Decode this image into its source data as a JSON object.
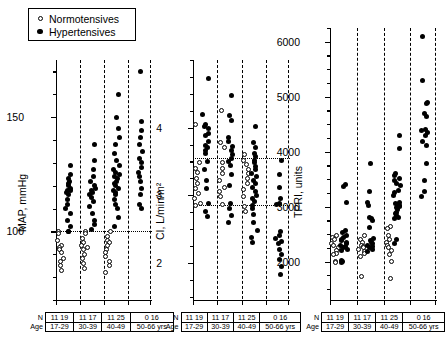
{
  "legend": {
    "items": [
      {
        "marker": "open-circle",
        "label": "Normotensives"
      },
      {
        "marker": "filled-circle",
        "label": "Hypertensives"
      }
    ]
  },
  "table": {
    "row_headers": [
      "N",
      "Age"
    ],
    "n_values": [
      "11 19",
      "11 17",
      "11 25",
      "0 16"
    ],
    "age_values": [
      "17-29",
      "30-39",
      "40-49",
      "50-66 yrs"
    ]
  },
  "chart_data": [
    {
      "type": "scatter",
      "title": "",
      "panel_id": "map",
      "ylabel": "MAP, mmHg",
      "xlabel": "",
      "ylim": [
        70,
        175
      ],
      "yticks": [
        100,
        150
      ],
      "ytick_labels": [
        "100",
        "150"
      ],
      "minor_tick_step": 10,
      "grid": false,
      "reference_lines": [
        100
      ],
      "categories": [
        "17-29",
        "30-39",
        "40-49",
        "50-66 yrs"
      ],
      "legend_position": "top-left",
      "series": [
        {
          "name": "Normotensives",
          "marker": "open-circle",
          "groups": [
            {
              "category": "17-29",
              "values": [
                100,
                99,
                96,
                94,
                93,
                92,
                91,
                88,
                87,
                85,
                83
              ]
            },
            {
              "category": "30-39",
              "values": [
                100,
                99,
                97,
                95,
                94,
                93,
                92,
                90,
                88,
                86,
                84
              ]
            },
            {
              "category": "40-49",
              "values": [
                100,
                98,
                96,
                95,
                94,
                92,
                91,
                89,
                87,
                85,
                82
              ]
            },
            {
              "category": "50-66 yrs",
              "values": []
            }
          ]
        },
        {
          "name": "Hypertensives",
          "marker": "filled-circle",
          "groups": [
            {
              "category": "17-29",
              "values": [
                129,
                125,
                123,
                122,
                121,
                120,
                119,
                118,
                118,
                117,
                116,
                114,
                112,
                110,
                108,
                105,
                102,
                100,
                100
              ]
            },
            {
              "category": "30-39",
              "values": [
                138,
                131,
                127,
                124,
                122,
                120,
                119,
                118,
                117,
                116,
                115,
                113,
                111,
                108,
                105,
                103,
                101
              ]
            },
            {
              "category": "40-49",
              "values": [
                160,
                150,
                145,
                141,
                138,
                134,
                131,
                129,
                127,
                126,
                125,
                124,
                123,
                122,
                121,
                120,
                119,
                118,
                117,
                116,
                114,
                112,
                110,
                106,
                102
              ]
            },
            {
              "category": "50-66 yrs",
              "values": [
                170,
                148,
                144,
                141,
                138,
                135,
                132,
                130,
                128,
                126,
                124,
                122,
                119,
                116,
                112,
                110
              ]
            }
          ]
        }
      ]
    },
    {
      "type": "scatter",
      "title": "",
      "panel_id": "ci",
      "ylabel": "CI, L/min/m2",
      "ylabel_display": "CI, L/min/m²",
      "xlabel": "",
      "ylim": [
        1.45,
        5.0
      ],
      "yticks": [
        2,
        3,
        4
      ],
      "ytick_labels": [
        "2",
        "3",
        "4"
      ],
      "minor_tick_step": 0.25,
      "grid": false,
      "reference_lines": [
        3.55,
        2.85
      ],
      "categories": [
        "17-29",
        "30-39",
        "40-49",
        "50-66 yrs"
      ],
      "series": [
        {
          "name": "Normotensives",
          "marker": "open-circle",
          "groups": [
            {
              "category": "17-29",
              "values": [
                4.05,
                3.48,
                3.4,
                3.33,
                3.25,
                3.17,
                3.1,
                3.02,
                2.95,
                2.88,
                2.85
              ]
            },
            {
              "category": "30-39",
              "values": [
                4.25,
                3.78,
                3.7,
                3.48,
                3.4,
                3.32,
                3.22,
                3.12,
                3.05,
                2.98,
                2.86
              ]
            },
            {
              "category": "40-49",
              "values": [
                3.6,
                3.52,
                3.45,
                3.38,
                3.32,
                3.25,
                3.18,
                3.08,
                2.98,
                2.84,
                2.76
              ]
            },
            {
              "category": "50-66 yrs",
              "values": []
            }
          ]
        },
        {
          "name": "Hypertensives",
          "marker": "filled-circle",
          "groups": [
            {
              "category": "17-29",
              "values": [
                4.72,
                4.2,
                4.05,
                4.02,
                3.98,
                3.92,
                3.88,
                3.8,
                3.74,
                3.7,
                3.66,
                3.62,
                3.5,
                3.38,
                3.22,
                3.1,
                2.88,
                2.76,
                2.68
              ]
            },
            {
              "category": "30-39",
              "values": [
                4.48,
                4.18,
                4.1,
                3.85,
                3.8,
                3.72,
                3.66,
                3.6,
                3.55,
                3.5,
                3.44,
                3.3,
                3.15,
                2.88,
                2.8,
                2.7,
                2.6
              ]
            },
            {
              "category": "40-49",
              "values": [
                4.02,
                3.78,
                3.7,
                3.62,
                3.58,
                3.52,
                3.48,
                3.42,
                3.38,
                3.32,
                3.28,
                3.22,
                3.18,
                3.12,
                3.05,
                3.0,
                2.95,
                2.9,
                2.85,
                2.8,
                2.72,
                2.6,
                2.48,
                2.38,
                2.3
              ]
            },
            {
              "category": "50-66 yrs",
              "values": [
                3.52,
                3.3,
                3.12,
                2.95,
                2.88,
                2.86,
                2.46,
                2.4,
                2.36,
                2.32,
                2.28,
                2.2,
                2.12,
                2.05,
                1.95,
                1.82
              ]
            }
          ]
        }
      ]
    },
    {
      "type": "scatter",
      "title": "",
      "panel_id": "tpri",
      "ylabel": "TPRI, units",
      "xlabel": "",
      "ylim": [
        1300,
        6250
      ],
      "yticks": [
        2000,
        3000,
        4000,
        5000,
        6000
      ],
      "ytick_labels": [
        "2000",
        "3000",
        "4000",
        "5000",
        "6000"
      ],
      "minor_tick_step": 250,
      "grid": false,
      "reference_lines": [],
      "categories": [
        "17-29",
        "30-39",
        "40-49",
        "50-66 yrs"
      ],
      "series": [
        {
          "name": "Normotensives",
          "marker": "open-circle",
          "groups": [
            {
              "category": "17-29",
              "values": [
                2480,
                2440,
                2400,
                2330,
                2300,
                2250,
                2200,
                2150,
                2120,
                2000,
                1990
              ]
            },
            {
              "category": "30-39",
              "values": [
                2480,
                2400,
                2350,
                2300,
                2280,
                2250,
                2220,
                2180,
                2150,
                2100,
                1720
              ]
            },
            {
              "category": "40-49",
              "values": [
                2630,
                2600,
                2480,
                2400,
                2350,
                2300,
                2250,
                2200,
                2120,
                2000,
                1700
              ]
            },
            {
              "category": "50-66 yrs",
              "values": []
            }
          ]
        },
        {
          "name": "Hypertensives",
          "marker": "filled-circle",
          "groups": [
            {
              "category": "17-29",
              "values": [
                3400,
                3360,
                3080,
                2560,
                2520,
                2480,
                2440,
                2400,
                2380,
                2350,
                2330,
                2300,
                2280,
                2250,
                2220,
                2200,
                2020,
                2000,
                1980
              ]
            },
            {
              "category": "30-39",
              "values": [
                3780,
                3280,
                3080,
                3020,
                2800,
                2780,
                2740,
                2620,
                2420,
                2380,
                2350,
                2320,
                2300,
                2280,
                2250,
                2220,
                2180
              ]
            },
            {
              "category": "40-49",
              "values": [
                4300,
                4060,
                3600,
                3560,
                3520,
                3480,
                3420,
                3380,
                3300,
                3250,
                3200,
                3080,
                3060,
                3040,
                3020,
                3000,
                2980,
                2950,
                2900,
                2880,
                2840,
                2800,
                2780,
                2400,
                2330
              ]
            },
            {
              "category": "50-66 yrs",
              "values": [
                6100,
                5300,
                4900,
                4880,
                4700,
                4640,
                4400,
                4380,
                4340,
                4300,
                4180,
                4120,
                3780,
                3480,
                3280,
                3180
              ]
            }
          ]
        }
      ]
    }
  ]
}
